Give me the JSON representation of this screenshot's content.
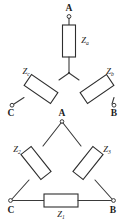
{
  "figure": {
    "background_color": "#ffffff",
    "line_color": "#3a3a3a",
    "text_color": "#1d1d1d"
  },
  "wye": {
    "name": "wye-star-network",
    "terminals": [
      {
        "id": "A",
        "label": "A",
        "position": "top"
      },
      {
        "id": "B",
        "label": "B",
        "position": "bottom-right"
      },
      {
        "id": "C",
        "label": "C",
        "position": "bottom-left"
      }
    ],
    "impedances": [
      {
        "id": "Za",
        "base": "Z",
        "subscript": "a",
        "branch": "A-center"
      },
      {
        "id": "Zb",
        "base": "Z",
        "subscript": "b",
        "branch": "B-center"
      },
      {
        "id": "Zc",
        "base": "Z",
        "subscript": "c",
        "branch": "C-center"
      }
    ]
  },
  "delta": {
    "name": "delta-triangle-network",
    "terminals": [
      {
        "id": "A",
        "label": "A",
        "position": "apex"
      },
      {
        "id": "B",
        "label": "B",
        "position": "bottom-right"
      },
      {
        "id": "C",
        "label": "C",
        "position": "bottom-left"
      }
    ],
    "impedances": [
      {
        "id": "Z1",
        "base": "Z",
        "subscript": "1",
        "branch": "C-B"
      },
      {
        "id": "Z2",
        "base": "Z",
        "subscript": "2",
        "branch": "C-A"
      },
      {
        "id": "Z3",
        "base": "Z",
        "subscript": "3",
        "branch": "A-B"
      }
    ]
  }
}
